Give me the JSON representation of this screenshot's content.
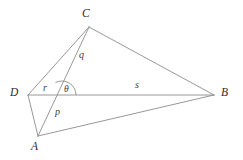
{
  "figure": {
    "type": "geometry-diagram",
    "width": 243,
    "height": 160,
    "background_color": "#ffffff",
    "stroke_color": "#8c8c8c",
    "stroke_width": 0.9,
    "text_color": "#2b2b2b"
  },
  "vertices": [
    {
      "id": "C",
      "label": "C",
      "x": 89,
      "y": 27,
      "label_x": 82,
      "label_y": 8
    },
    {
      "id": "D",
      "label": "D",
      "x": 28,
      "y": 95,
      "label_x": 10,
      "label_y": 87
    },
    {
      "id": "A",
      "label": "A",
      "x": 38,
      "y": 136,
      "label_x": 31,
      "label_y": 141
    },
    {
      "id": "B",
      "label": "B",
      "x": 214,
      "y": 95,
      "label_x": 221,
      "label_y": 87
    }
  ],
  "edges": [
    {
      "id": "DC",
      "from": "D",
      "to": "C",
      "description": "segment from D to C"
    },
    {
      "id": "CB",
      "from": "C",
      "to": "B",
      "description": "segment from C to B"
    },
    {
      "id": "DB",
      "from": "D",
      "to": "B",
      "description": "segment from D to B"
    },
    {
      "id": "DA",
      "from": "D",
      "to": "A",
      "description": "segment from D to A"
    },
    {
      "id": "AB",
      "from": "A",
      "to": "B",
      "description": "segment from A to B"
    },
    {
      "id": "CA",
      "from": "C",
      "to": "A",
      "description": "segment from C to A crossing DB"
    }
  ],
  "segment_labels": [
    {
      "id": "q",
      "label": "q",
      "x": 79,
      "y": 50,
      "for_edge": "CA",
      "note": "upper part of segment CA, from C to intersection"
    },
    {
      "id": "r",
      "label": "r",
      "x": 43,
      "y": 83,
      "for_edge": "DB",
      "note": "part of DB from D to intersection"
    },
    {
      "id": "s",
      "label": "s",
      "x": 135,
      "y": 80,
      "for_edge": "DB",
      "note": "part of DB from intersection to B"
    },
    {
      "id": "p",
      "label": "p",
      "x": 55,
      "y": 107,
      "for_edge": "CA",
      "note": "lower part of segment CA, from intersection to A"
    }
  ],
  "angles": [
    {
      "id": "theta",
      "label": "θ",
      "label_x": 64,
      "label_y": 85,
      "vertex_x": 62,
      "vertex_y": 95,
      "radius": 14,
      "note": "angle between segment towards C and segment towards B at intersection point"
    }
  ],
  "intersection": {
    "x": 62,
    "y": 95,
    "note": "CA crosses DB here"
  }
}
